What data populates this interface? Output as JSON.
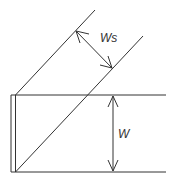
{
  "diagram": {
    "labels": {
      "ws": "Ws",
      "w": "W"
    },
    "colors": {
      "line": "#333333",
      "background": "#ffffff"
    }
  }
}
